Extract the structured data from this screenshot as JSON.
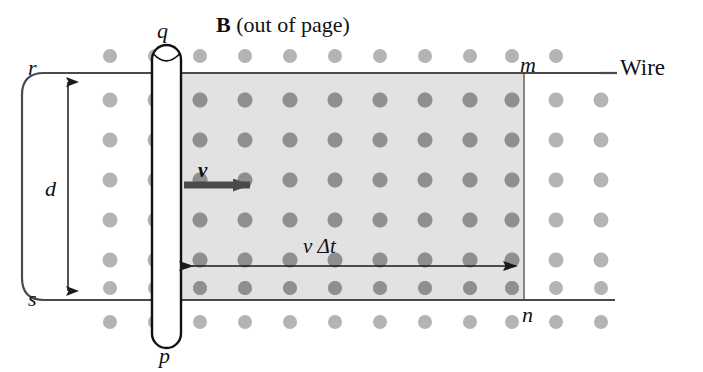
{
  "figure": {
    "width": 703,
    "height": 372,
    "background": "#ffffff"
  },
  "labels": {
    "field_label": "B",
    "field_note": " (out of page)",
    "wire": "Wire",
    "rod_top": "q",
    "rod_bottom": "p",
    "rail_top_left": "r",
    "rail_bottom_left": "s",
    "rail_top_right": "m",
    "rail_bottom_right": "n",
    "separation": "d",
    "velocity": "v",
    "swept_distance_v": "v",
    "swept_distance_dt": " Δt"
  },
  "colors": {
    "line": "#3a3a3a",
    "rod_outline": "#111111",
    "rod_fill": "#ffffff",
    "shaded_field_region": "#e2e2e2",
    "dot_outside": "#b4b4b4",
    "dot_inside": "#8f8f8f",
    "arrow_velocity": "#4a4a4a",
    "arrow_dimension": "#1a1a1a",
    "text": "#111111"
  },
  "geometry": {
    "top_rail_y": 73,
    "bottom_rail_y": 300,
    "rail_left_x": 22,
    "rail_right_x": 615,
    "rod_left_x": 152,
    "rod_right_x": 181,
    "rod_top_y": 45,
    "rod_bottom_y": 348,
    "field_region_left_x": 181,
    "field_region_right_x": 524,
    "dot_rows": 8,
    "dot_cols": 13,
    "dot_spacing_x": 45,
    "dot_spacing_y": 38,
    "dot_radius": 7
  },
  "annotations": {
    "separation_arrow": {
      "name": "d",
      "orientation": "vertical",
      "double_headed": true,
      "x": 68,
      "y_top": 78,
      "y_bottom": 296
    },
    "velocity_arrow": {
      "name": "v",
      "orientation": "horizontal-right",
      "x_start": 183,
      "x_end": 262,
      "y": 185
    },
    "swept_distance_arrow": {
      "name": "v dt",
      "orientation": "horizontal-double",
      "x_left": 183,
      "x_right": 524,
      "y": 266
    }
  }
}
